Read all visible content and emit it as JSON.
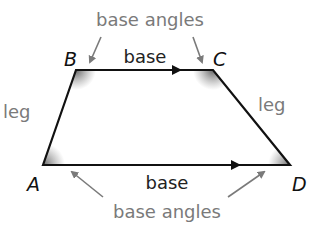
{
  "diagram": {
    "vertices": {
      "A": {
        "label": "A",
        "x": 43,
        "y": 165
      },
      "B": {
        "label": "B",
        "x": 76,
        "y": 70
      },
      "C": {
        "label": "C",
        "x": 213,
        "y": 70
      },
      "D": {
        "label": "D",
        "x": 290,
        "y": 165
      }
    },
    "labels": {
      "top_base": "base",
      "bottom_base": "base",
      "left_leg": "leg",
      "right_leg": "leg",
      "top_base_angles": "base angles",
      "bottom_base_angles": "base angles"
    },
    "colors": {
      "outline": "#111111",
      "annotation": "#7a7a7a",
      "angle_shade": "#666666"
    }
  }
}
